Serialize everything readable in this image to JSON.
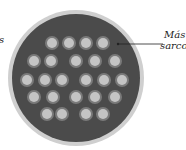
{
  "diagram": {
    "labels": {
      "left_partial": "s",
      "right_line1": "Más",
      "right_line2": "sarco"
    },
    "colors": {
      "rim": "#c8c8c8",
      "interior": "#4a4a4a",
      "dot_halo": "#7a7a7a",
      "dot_core": "#c4c4c4"
    },
    "rows": [
      {
        "y": 43,
        "xs": [
          52,
          69,
          86,
          103
        ]
      },
      {
        "y": 61,
        "xs": [
          34,
          51,
          76,
          95,
          115
        ]
      },
      {
        "y": 80,
        "xs": [
          27,
          45,
          62,
          86,
          104,
          122
        ]
      },
      {
        "y": 97,
        "xs": [
          34,
          53,
          76,
          95,
          115
        ]
      },
      {
        "y": 114,
        "xs": [
          47,
          62,
          86,
          103
        ]
      }
    ]
  }
}
